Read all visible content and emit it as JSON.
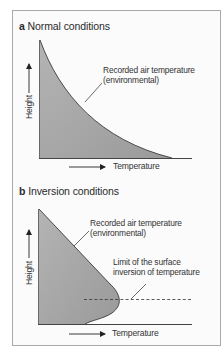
{
  "diagram": {
    "panels": [
      {
        "id": "a",
        "letter": "a",
        "title": "Normal conditions",
        "curve_annotation": [
          "Recorded air temperature",
          "(environmental)"
        ],
        "y_axis_label": "Height",
        "x_axis_label": "Temperature",
        "profile": "temperature decreases continuously with height"
      },
      {
        "id": "b",
        "letter": "b",
        "title": "Inversion conditions",
        "curve_annotation": [
          "Recorded air temperature",
          "(environmental)"
        ],
        "inversion_annotation": [
          "Limit of the surface",
          "inversion of temperature"
        ],
        "y_axis_label": "Height",
        "x_axis_label": "Temperature",
        "profile": "temperature increases with height near the surface up to the inversion limit, then decreases"
      }
    ],
    "colors": {
      "fill": "#a3a3a3",
      "line": "#3a3a3a",
      "frame": "#a9a9a9",
      "background": "#fbfbfb"
    }
  }
}
